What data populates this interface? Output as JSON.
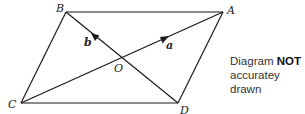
{
  "diagram": {
    "type": "parallelogram-vectors",
    "points": {
      "A": {
        "label": "A",
        "x": 223,
        "y": 12
      },
      "B": {
        "label": "B",
        "x": 66,
        "y": 12
      },
      "C": {
        "label": "C",
        "x": 21,
        "y": 103
      },
      "D": {
        "label": "D",
        "x": 178,
        "y": 103
      },
      "O": {
        "label": "O",
        "x": 121,
        "y": 58
      }
    },
    "vectors": [
      {
        "label": "a",
        "from": "O",
        "to": "A"
      },
      {
        "label": "b",
        "from": "O",
        "to": "B"
      }
    ],
    "edges": [
      [
        "B",
        "A"
      ],
      [
        "A",
        "D"
      ],
      [
        "D",
        "C"
      ],
      [
        "C",
        "B"
      ],
      [
        "C",
        "A"
      ],
      [
        "B",
        "D"
      ]
    ],
    "stroke_color": "#1a1a1a"
  },
  "note": {
    "line1_prefix": "Diagram ",
    "line1_bold": "NOT",
    "line2": "accuratey drawn"
  }
}
